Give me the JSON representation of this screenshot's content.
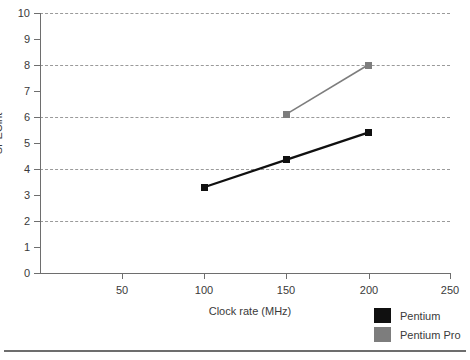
{
  "chart_data": {
    "type": "line",
    "title": "",
    "xlabel": "Clock rate (MHz)",
    "ylabel": "SPECint",
    "xlim": [
      0,
      250
    ],
    "ylim": [
      0,
      10
    ],
    "x_ticks": [
      50,
      100,
      150,
      200,
      250
    ],
    "y_ticks": [
      0,
      1,
      2,
      3,
      4,
      5,
      6,
      7,
      8,
      9,
      10
    ],
    "gridlines_y": [
      2,
      4,
      6,
      8,
      10
    ],
    "grid": "horizontal-dashed",
    "legend_position": "bottom-right",
    "series": [
      {
        "name": "Pentium",
        "color": "#101010",
        "x": [
          100,
          150,
          200
        ],
        "values": [
          3.3,
          4.35,
          5.4
        ]
      },
      {
        "name": "Pentium Pro",
        "color": "#7d7d7d",
        "x": [
          150,
          200
        ],
        "values": [
          6.1,
          8.0
        ]
      }
    ]
  },
  "axis": {
    "y_tick_labels": [
      "10",
      "9",
      "8",
      "7",
      "6",
      "5",
      "4",
      "3",
      "2",
      "1",
      "0"
    ],
    "x_tick_labels": [
      "50",
      "100",
      "150",
      "200",
      "250"
    ]
  },
  "legend": {
    "items": [
      {
        "label": "Pentium",
        "color": "#101010"
      },
      {
        "label": "Pentium Pro",
        "color": "#7d7d7d"
      }
    ]
  },
  "colors": {
    "axis": "#6e6e6e",
    "grid": "#9a9a9a",
    "text": "#3a3a3a",
    "rule": "#6d6d6d",
    "background": "#ffffff"
  }
}
